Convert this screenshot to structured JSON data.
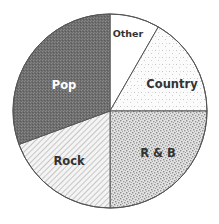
{
  "chart_data": {
    "type": "pie",
    "title": "",
    "start_angle_deg": 0,
    "direction": "clockwise",
    "slices": [
      {
        "label": "Other",
        "value": 8.3,
        "pattern": "solid-white",
        "fill": "#ffffff",
        "label_color": "#333333"
      },
      {
        "label": "Country",
        "value": 16.7,
        "pattern": "sparse-dots",
        "fill": "#ffffff",
        "label_color": "#333333"
      },
      {
        "label": "R & B",
        "value": 25.0,
        "pattern": "stipple",
        "fill": "#c8c8c8",
        "label_color": "#333333"
      },
      {
        "label": "Rock",
        "value": 19.4,
        "pattern": "diagonal-hatch",
        "fill": "#f2f2f2",
        "label_color": "#333333"
      },
      {
        "label": "Pop",
        "value": 30.6,
        "pattern": "dark-checker",
        "fill": "#707070",
        "label_color": "#ffffff"
      }
    ],
    "legend": "none",
    "labels_inside": true,
    "outline_color": "#555555"
  },
  "labels": {
    "other": "Other",
    "country": "Country",
    "rnb": "R & B",
    "rock": "Rock",
    "pop": "Pop"
  }
}
